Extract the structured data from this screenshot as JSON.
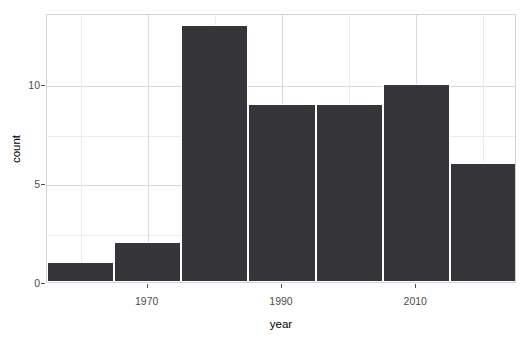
{
  "chart_data": {
    "type": "bar",
    "title": "",
    "subtitle": "",
    "xlabel": "year",
    "ylabel": "count",
    "grid": true,
    "legend": "none",
    "xlim": [
      1955,
      2025
    ],
    "ylim": [
      0,
      13.6
    ],
    "x_ticks": [
      1970,
      1990,
      2010
    ],
    "x_tick_labels": [
      "1970",
      "1990",
      "2010"
    ],
    "x_minor_ticks": [
      1960,
      1980,
      2000,
      2020
    ],
    "y_ticks": [
      0,
      5,
      10
    ],
    "y_tick_labels": [
      "0",
      "5",
      "10"
    ],
    "y_minor_ticks": [
      2.5,
      7.5
    ],
    "bin_width": 10,
    "bin_edges": [
      1955,
      1965,
      1975,
      1985,
      1995,
      2005,
      2015,
      2025
    ],
    "categories": [
      "1955-1965",
      "1965-1975",
      "1975-1985",
      "1985-1995",
      "1995-2005",
      "2005-2015",
      "2015-2025"
    ],
    "bin_centers": [
      1960,
      1970,
      1980,
      1990,
      2000,
      2010,
      2020
    ],
    "values": [
      1,
      2,
      13,
      9,
      9,
      10,
      6
    ],
    "bar_color": "#35353a",
    "bar_border_color": "#ffffff",
    "panel_background": "#ffffff",
    "panel_border_color": "#d4d4d4",
    "grid_major_color": "#d9d9d9",
    "grid_minor_color": "#ebebeb",
    "tick_label_color": "#4d4d4d",
    "axis_title_color": "#000000"
  }
}
